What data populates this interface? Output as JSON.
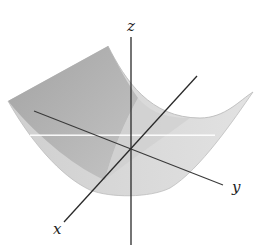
{
  "figure": {
    "type": "3d-surface-sketch",
    "axes": {
      "x": {
        "label": "x"
      },
      "y": {
        "label": "y"
      },
      "z": {
        "label": "z"
      }
    },
    "colors": {
      "background": "#ffffff",
      "surface_front": "#d8d8d8",
      "surface_back": "#a9a9a9",
      "axis_line": "#2a2a2a",
      "stripe": "#ffffff"
    }
  }
}
